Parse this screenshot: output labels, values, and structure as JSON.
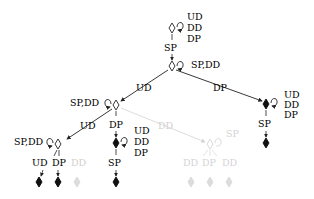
{
  "diagram": {
    "type": "state-tree",
    "colors": {
      "active": "#111111",
      "faded": "#cfcfcf",
      "line": "#222222"
    },
    "root": {
      "self_loop_labels": [
        "UD",
        "DD",
        "DP"
      ],
      "down_label": "SP"
    },
    "level1": {
      "self_loop_label": "SP,DD",
      "left_edge_label": "UD",
      "right_edge_label": "DP"
    },
    "right_branch": {
      "self_loop_labels": [
        "UD",
        "DD",
        "DP"
      ],
      "down_label": "SP"
    },
    "level2_left": {
      "self_loop_label": "SP,DD",
      "left_edge_label": "UD",
      "down_edge_label": "DP",
      "right_edge_label": "DD"
    },
    "level2_mid": {
      "self_loop_labels": [
        "UD",
        "DD",
        "DP"
      ],
      "down_label": "SP"
    },
    "level3_left": {
      "self_loop_label": "SP,DD",
      "children_labels": [
        "UD",
        "DP",
        "DD"
      ]
    },
    "faded_node": {
      "self_loop_label": "SP",
      "children_labels": [
        "DD",
        "DP",
        "DD"
      ]
    }
  }
}
